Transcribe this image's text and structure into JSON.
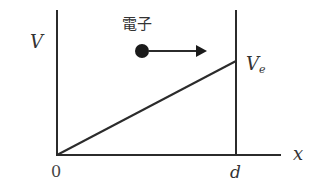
{
  "diagram": {
    "title": "",
    "axes": {
      "y_label": "V",
      "x_label": "x",
      "origin_label": "0",
      "plate_position_label": "d"
    },
    "electron": {
      "label": "電子",
      "direction": "right"
    },
    "potential_line": {
      "from": "0",
      "to": "Ve",
      "end_label_main": "V",
      "end_label_sub": "e"
    },
    "colors": {
      "line": "#2b2b2b",
      "text": "#333333",
      "background": "#ffffff"
    }
  }
}
